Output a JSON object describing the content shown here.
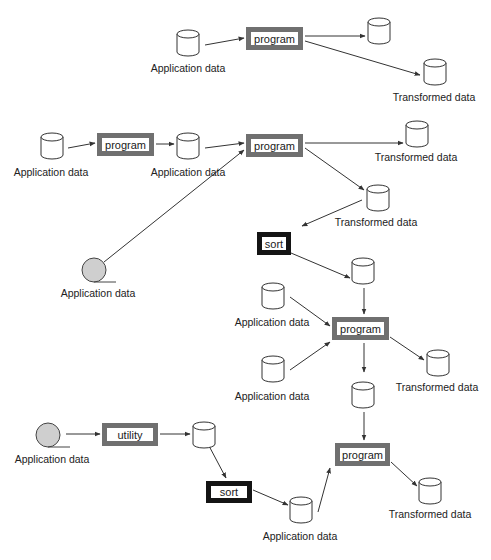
{
  "diagram": {
    "colors": {
      "program_border": "#707070",
      "sort_border": "#141414",
      "tape_fill": "#cfcfcf",
      "line": "#333333"
    },
    "processes": [
      {
        "id": "p1",
        "label": "program",
        "style": "gray",
        "x": 246,
        "y": 27,
        "w": 57,
        "h": 23
      },
      {
        "id": "p2",
        "label": "program",
        "style": "gray",
        "x": 97,
        "y": 133,
        "w": 57,
        "h": 23
      },
      {
        "id": "p3",
        "label": "program",
        "style": "gray",
        "x": 246,
        "y": 134,
        "w": 57,
        "h": 23
      },
      {
        "id": "s1",
        "label": "sort",
        "style": "black",
        "x": 257,
        "y": 232,
        "w": 34,
        "h": 23
      },
      {
        "id": "p4",
        "label": "program",
        "style": "gray",
        "x": 332,
        "y": 317,
        "w": 57,
        "h": 23
      },
      {
        "id": "u1",
        "label": "utility",
        "style": "gray",
        "x": 102,
        "y": 423,
        "w": 56,
        "h": 23
      },
      {
        "id": "s2",
        "label": "sort",
        "style": "black",
        "x": 206,
        "y": 481,
        "w": 46,
        "h": 22
      },
      {
        "id": "p5",
        "label": "program",
        "style": "gray",
        "x": 335,
        "y": 443,
        "w": 55,
        "h": 23
      }
    ],
    "datastores": [
      {
        "id": "d1",
        "type": "disk",
        "x": 177,
        "y": 30,
        "label": "Application data",
        "lx": 188,
        "ly": 62
      },
      {
        "id": "d2",
        "type": "disk",
        "x": 368,
        "y": 18,
        "label": "",
        "lx": 0,
        "ly": 0
      },
      {
        "id": "d3",
        "type": "disk",
        "x": 424,
        "y": 59,
        "label": "Transformed data",
        "lx": 434,
        "ly": 91
      },
      {
        "id": "d4",
        "type": "disk",
        "x": 41,
        "y": 133,
        "label": "Application data",
        "lx": 51,
        "ly": 166
      },
      {
        "id": "d5",
        "type": "disk",
        "x": 177,
        "y": 133,
        "label": "Application data",
        "lx": 188,
        "ly": 166
      },
      {
        "id": "d6",
        "type": "disk",
        "x": 406,
        "y": 121,
        "label": "Transformed data",
        "lx": 416,
        "ly": 151
      },
      {
        "id": "t1",
        "type": "tape",
        "x": 94,
        "y": 270,
        "label": "Application data",
        "lx": 98,
        "ly": 287
      },
      {
        "id": "d7",
        "type": "disk",
        "x": 367,
        "y": 185,
        "label": "Transformed data",
        "lx": 376,
        "ly": 216
      },
      {
        "id": "d8",
        "type": "disk",
        "x": 352,
        "y": 258,
        "label": "",
        "lx": 0,
        "ly": 0
      },
      {
        "id": "d9",
        "type": "disk",
        "x": 262,
        "y": 283,
        "label": "Application data",
        "lx": 272,
        "ly": 316
      },
      {
        "id": "d10",
        "type": "disk",
        "x": 262,
        "y": 356,
        "label": "Application data",
        "lx": 272,
        "ly": 390
      },
      {
        "id": "d11",
        "type": "disk",
        "x": 427,
        "y": 350,
        "label": "Transformed data",
        "lx": 437,
        "ly": 381
      },
      {
        "id": "d12",
        "type": "disk",
        "x": 352,
        "y": 382,
        "label": "",
        "lx": 0,
        "ly": 0
      },
      {
        "id": "t2",
        "type": "tape",
        "x": 48,
        "y": 435,
        "label": "Application data",
        "lx": 52,
        "ly": 453
      },
      {
        "id": "d13",
        "type": "disk",
        "x": 193,
        "y": 422,
        "label": "",
        "lx": 0,
        "ly": 0
      },
      {
        "id": "d14",
        "type": "disk",
        "x": 290,
        "y": 497,
        "label": "Application data",
        "lx": 300,
        "ly": 530
      },
      {
        "id": "d15",
        "type": "disk",
        "x": 419,
        "y": 478,
        "label": "Transformed data",
        "lx": 430,
        "ly": 508
      }
    ],
    "edges": [
      {
        "from": [
          205,
          45
        ],
        "to": [
          244,
          38
        ],
        "arrow": true
      },
      {
        "from": [
          305,
          36
        ],
        "to": [
          365,
          36
        ],
        "arrow": true
      },
      {
        "from": [
          305,
          41
        ],
        "to": [
          420,
          75
        ],
        "arrow": true
      },
      {
        "from": [
          68,
          148
        ],
        "to": [
          95,
          143
        ],
        "arrow": true
      },
      {
        "from": [
          156,
          144
        ],
        "to": [
          174,
          144
        ],
        "arrow": true
      },
      {
        "from": [
          205,
          148
        ],
        "to": [
          244,
          143
        ],
        "arrow": true
      },
      {
        "from": [
          104,
          262
        ],
        "to": [
          244,
          150
        ],
        "arrow": true
      },
      {
        "from": [
          305,
          143
        ],
        "to": [
          403,
          143
        ],
        "arrow": true
      },
      {
        "from": [
          305,
          148
        ],
        "to": [
          364,
          190
        ],
        "arrow": true
      },
      {
        "from": [
          362,
          200
        ],
        "to": [
          302,
          226
        ],
        "arrow": true
      },
      {
        "from": [
          291,
          253
        ],
        "to": [
          350,
          278
        ],
        "arrow": true
      },
      {
        "from": [
          364,
          288
        ],
        "to": [
          364,
          314
        ],
        "arrow": true
      },
      {
        "from": [
          290,
          297
        ],
        "to": [
          330,
          326
        ],
        "arrow": true
      },
      {
        "from": [
          290,
          370
        ],
        "to": [
          330,
          342
        ],
        "arrow": true
      },
      {
        "from": [
          364,
          343
        ],
        "to": [
          364,
          372
        ],
        "arrow": true
      },
      {
        "from": [
          390,
          337
        ],
        "to": [
          424,
          360
        ],
        "arrow": true
      },
      {
        "from": [
          364,
          412
        ],
        "to": [
          364,
          440
        ],
        "arrow": true
      },
      {
        "from": [
          66,
          434
        ],
        "to": [
          100,
          434
        ],
        "arrow": true
      },
      {
        "from": [
          160,
          434
        ],
        "to": [
          190,
          434
        ],
        "arrow": true
      },
      {
        "from": [
          208,
          444
        ],
        "to": [
          226,
          478
        ],
        "arrow": true
      },
      {
        "from": [
          253,
          490
        ],
        "to": [
          288,
          505
        ],
        "arrow": true
      },
      {
        "from": [
          318,
          512
        ],
        "to": [
          330,
          468
        ],
        "arrow": true
      },
      {
        "from": [
          391,
          462
        ],
        "to": [
          417,
          486
        ],
        "arrow": true
      }
    ]
  }
}
